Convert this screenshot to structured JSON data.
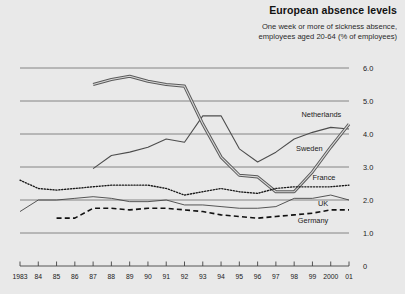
{
  "header": {
    "title": "European absence levels",
    "subtitle_line1": "One week or more of sickness absence,",
    "subtitle_line2": "employees aged 20-64 (% of employees)"
  },
  "chart_data": {
    "type": "line",
    "title": "European absence levels",
    "subtitle": "One week or more of sickness absence, employees aged 20-64 (% of employees)",
    "xlabel": "",
    "ylabel": "% of employees",
    "ylim": [
      0,
      6.0
    ],
    "ytick_labels": [
      "6.0",
      "5.0",
      "4.0",
      "3.0",
      "2.0",
      "1.0",
      "0"
    ],
    "ytick_values": [
      6.0,
      5.0,
      4.0,
      3.0,
      2.0,
      1.0,
      0
    ],
    "grid": true,
    "legend_position": "inline-right",
    "x": [
      1983,
      1984,
      1985,
      1986,
      1987,
      1988,
      1989,
      1990,
      1991,
      1992,
      1993,
      1994,
      1995,
      1996,
      1997,
      1998,
      1999,
      2000,
      2001
    ],
    "xtick_labels": [
      "1983",
      "84",
      "85",
      "86",
      "87",
      "88",
      "89",
      "90",
      "91",
      "92",
      "93",
      "94",
      "95",
      "96",
      "97",
      "98",
      "99",
      "2000",
      "01"
    ],
    "series": [
      {
        "name": "Netherlands",
        "style": "thin-solid",
        "color": "#4d4d4d",
        "x": [
          1987,
          1988,
          1989,
          1990,
          1991,
          1992,
          1993,
          1994,
          1995,
          1996,
          1997,
          1998,
          1999,
          2000,
          2001
        ],
        "values": [
          2.95,
          3.35,
          3.45,
          3.6,
          3.85,
          3.75,
          4.55,
          4.55,
          3.55,
          3.15,
          3.45,
          3.85,
          4.05,
          4.2,
          4.15
        ]
      },
      {
        "name": "Sweden",
        "style": "thick-double",
        "color": "#5a5a5a",
        "x": [
          1987,
          1988,
          1989,
          1990,
          1991,
          1992,
          1993,
          1994,
          1995,
          1996,
          1997,
          1998,
          1999,
          2000,
          2001
        ],
        "values": [
          5.5,
          5.65,
          5.75,
          5.6,
          5.5,
          5.45,
          4.3,
          3.3,
          2.75,
          2.7,
          2.25,
          2.25,
          2.85,
          3.6,
          4.3
        ]
      },
      {
        "name": "France",
        "style": "dotted",
        "color": "#1a1a1a",
        "x": [
          1983,
          1984,
          1985,
          1986,
          1987,
          1988,
          1989,
          1990,
          1991,
          1992,
          1993,
          1994,
          1995,
          1996,
          1997,
          1998,
          1999,
          2000,
          2001
        ],
        "values": [
          2.6,
          2.35,
          2.3,
          2.35,
          2.4,
          2.45,
          2.45,
          2.45,
          2.35,
          2.15,
          2.25,
          2.35,
          2.25,
          2.2,
          2.35,
          2.4,
          2.4,
          2.4,
          2.45
        ]
      },
      {
        "name": "UK",
        "style": "thin-solid",
        "color": "#3a3a3a",
        "x": [
          1983,
          1984,
          1985,
          1986,
          1987,
          1988,
          1989,
          1990,
          1991,
          1992,
          1993,
          1994,
          1995,
          1996,
          1997,
          1998,
          1999,
          2000,
          2001
        ],
        "values": [
          1.65,
          2.0,
          2.0,
          2.05,
          2.1,
          2.05,
          1.95,
          1.95,
          2.0,
          1.85,
          1.85,
          1.8,
          1.75,
          1.75,
          1.8,
          2.05,
          2.05,
          2.15,
          2.0
        ]
      },
      {
        "name": "Germany",
        "style": "dashed",
        "color": "#111111",
        "x": [
          1985,
          1986,
          1987,
          1988,
          1989,
          1990,
          1991,
          1992,
          1993,
          1994,
          1995,
          1996,
          1997,
          1998,
          1999,
          2000,
          2001
        ],
        "values": [
          1.45,
          1.45,
          1.75,
          1.75,
          1.7,
          1.75,
          1.75,
          1.7,
          1.65,
          1.55,
          1.5,
          1.45,
          1.5,
          1.55,
          1.6,
          1.7,
          1.7
        ]
      }
    ],
    "series_labels": [
      {
        "name": "Netherlands",
        "label": "Netherlands"
      },
      {
        "name": "Sweden",
        "label": "Sweden"
      },
      {
        "name": "France",
        "label": "France"
      },
      {
        "name": "UK",
        "label": "UK"
      },
      {
        "name": "Germany",
        "label": "Germany"
      }
    ]
  }
}
